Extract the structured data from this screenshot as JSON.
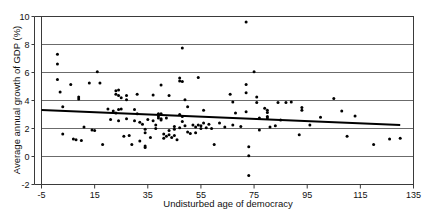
{
  "chart_data": {
    "type": "scatter",
    "title": "",
    "xlabel": "Undisturbed age of democracy",
    "ylabel": "Average annual growth of GDP (%)",
    "xlim": [
      -5,
      135
    ],
    "ylim": [
      -2,
      10
    ],
    "xticks": [
      -5,
      15,
      35,
      55,
      75,
      95,
      115,
      135
    ],
    "yticks": [
      -2,
      0,
      2,
      4,
      6,
      8,
      10
    ],
    "xtick_labels": [
      "-5",
      "15",
      "35",
      "55",
      "75",
      "95",
      "115",
      "135"
    ],
    "ytick_labels": [
      "-2",
      "0",
      "2",
      "4",
      "6",
      "8",
      "10"
    ],
    "grid": "horizontal",
    "legend": "none",
    "marker": "filled-circle",
    "series": [
      {
        "name": "countries",
        "points": [
          [
            1,
            7.3
          ],
          [
            1,
            6.6
          ],
          [
            1,
            5.5
          ],
          [
            2,
            4.6
          ],
          [
            3,
            3.55
          ],
          [
            3,
            1.6
          ],
          [
            6,
            5.15
          ],
          [
            7,
            1.25
          ],
          [
            8,
            1.2
          ],
          [
            9,
            4.25
          ],
          [
            9,
            4.1
          ],
          [
            10,
            1.15
          ],
          [
            11,
            2.1
          ],
          [
            13,
            5.25
          ],
          [
            14,
            1.9
          ],
          [
            15,
            1.85
          ],
          [
            16,
            6.05
          ],
          [
            17,
            5.25
          ],
          [
            18,
            0.85
          ],
          [
            20,
            3.4
          ],
          [
            21,
            2.65
          ],
          [
            22,
            3.25
          ],
          [
            23,
            4.7
          ],
          [
            23,
            4.45
          ],
          [
            23,
            3.1
          ],
          [
            24,
            4.75
          ],
          [
            24,
            4.35
          ],
          [
            24,
            3.35
          ],
          [
            24,
            2.55
          ],
          [
            25,
            4.2
          ],
          [
            25,
            3.4
          ],
          [
            26,
            1.45
          ],
          [
            27,
            4.35
          ],
          [
            27,
            4.05
          ],
          [
            27,
            2.7
          ],
          [
            28,
            1.5
          ],
          [
            29,
            0.85
          ],
          [
            30,
            3.35
          ],
          [
            30,
            2.55
          ],
          [
            31,
            4.45
          ],
          [
            31,
            3.05
          ],
          [
            32,
            2.45
          ],
          [
            32,
            1.1
          ],
          [
            33,
            2.3
          ],
          [
            34,
            1.95
          ],
          [
            34,
            1.7
          ],
          [
            34,
            0.75
          ],
          [
            34,
            0.65
          ],
          [
            35,
            2.65
          ],
          [
            36,
            1.35
          ],
          [
            37,
            4.4
          ],
          [
            37,
            2.55
          ],
          [
            38,
            2.25
          ],
          [
            38,
            2.0
          ],
          [
            39,
            3.05
          ],
          [
            39,
            2.9
          ],
          [
            39,
            2.75
          ],
          [
            40,
            5.1
          ],
          [
            40,
            3.05
          ],
          [
            40,
            2.7
          ],
          [
            40,
            2.6
          ],
          [
            41,
            1.6
          ],
          [
            41,
            1.3
          ],
          [
            42,
            2.75
          ],
          [
            42,
            1.45
          ],
          [
            43,
            4.35
          ],
          [
            43,
            1.85
          ],
          [
            43,
            1.55
          ],
          [
            44,
            1.35
          ],
          [
            45,
            2.15
          ],
          [
            45,
            1.95
          ],
          [
            45,
            1.5
          ],
          [
            46,
            1.2
          ],
          [
            47,
            5.6
          ],
          [
            47,
            5.4
          ],
          [
            47,
            3.0
          ],
          [
            47,
            2.05
          ],
          [
            48,
            7.75
          ],
          [
            48,
            5.35
          ],
          [
            48,
            2.85
          ],
          [
            48,
            2.5
          ],
          [
            49,
            4.05
          ],
          [
            49,
            2.2
          ],
          [
            50,
            3.55
          ],
          [
            50,
            1.75
          ],
          [
            51,
            1.65
          ],
          [
            52,
            2.25
          ],
          [
            53,
            2.1
          ],
          [
            53,
            1.7
          ],
          [
            54,
            5.65
          ],
          [
            54,
            2.25
          ],
          [
            55,
            2.2
          ],
          [
            55,
            2.0
          ],
          [
            56,
            3.3
          ],
          [
            56,
            2.4
          ],
          [
            57,
            2.05
          ],
          [
            58,
            2.3
          ],
          [
            59,
            2.0
          ],
          [
            60,
            0.85
          ],
          [
            62,
            2.4
          ],
          [
            64,
            2.1
          ],
          [
            66,
            4.45
          ],
          [
            67,
            3.9
          ],
          [
            67,
            2.25
          ],
          [
            68,
            3.1
          ],
          [
            70,
            2.15
          ],
          [
            72,
            9.6
          ],
          [
            72,
            5.15
          ],
          [
            72,
            4.55
          ],
          [
            72,
            3.2
          ],
          [
            73,
            0.7
          ],
          [
            73,
            0.05
          ],
          [
            73,
            -1.35
          ],
          [
            75,
            6.05
          ],
          [
            76,
            4.25
          ],
          [
            76,
            3.85
          ],
          [
            77,
            2.75
          ],
          [
            77,
            1.9
          ],
          [
            79,
            3.45
          ],
          [
            80,
            3.3
          ],
          [
            80,
            3.15
          ],
          [
            80,
            2.85
          ],
          [
            80,
            2.75
          ],
          [
            81,
            2.1
          ],
          [
            83,
            2.2
          ],
          [
            84,
            3.85
          ],
          [
            85,
            2.6
          ],
          [
            87,
            3.85
          ],
          [
            89,
            3.9
          ],
          [
            92,
            1.55
          ],
          [
            93,
            3.5
          ],
          [
            93,
            3.3
          ],
          [
            96,
            2.25
          ],
          [
            100,
            2.8
          ],
          [
            105,
            4.15
          ],
          [
            108,
            3.25
          ],
          [
            110,
            1.45
          ],
          [
            113,
            2.9
          ],
          [
            120,
            0.85
          ],
          [
            126,
            1.25
          ],
          [
            130,
            1.3
          ]
        ]
      }
    ],
    "trend_line": {
      "name": "linear fit",
      "x_start": -5,
      "y_start": 3.32,
      "x_end": 130,
      "y_end": 2.25
    }
  }
}
